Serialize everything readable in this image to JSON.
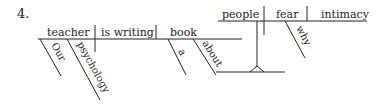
{
  "item_number": "4.",
  "colors": {
    "ink": "#222222",
    "background": "#ffffff"
  },
  "main_clause": {
    "subject": "teacher",
    "verb": "is writing",
    "direct_object": "book",
    "subject_modifiers": [
      "Our",
      "psychology"
    ],
    "object_modifiers": [
      "a",
      "about"
    ]
  },
  "sub_clause": {
    "subject": "people",
    "verb": "fear",
    "direct_object": "intimacy",
    "verb_modifier": "why"
  }
}
